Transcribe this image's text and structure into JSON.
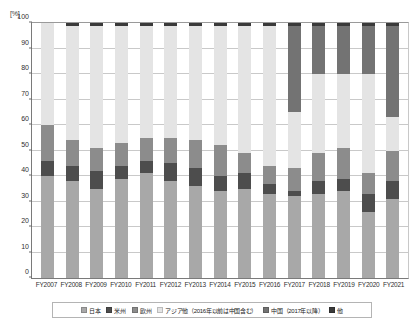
{
  "axis": {
    "y_unit": "[%]",
    "y_ticks": [
      0,
      10,
      20,
      30,
      40,
      50,
      60,
      70,
      80,
      90,
      100
    ]
  },
  "legend": {
    "items": [
      {
        "label": "日本",
        "color": "#a8a8a8",
        "key": "japan"
      },
      {
        "label": "米州",
        "color": "#4d4d4d",
        "key": "americas"
      },
      {
        "label": "欧州",
        "color": "#8c8c8c",
        "key": "europe"
      },
      {
        "label": "アジア他（2016年以前は中国含む）",
        "color": "#e4e4e4",
        "key": "asia_other"
      },
      {
        "label": "中国（2017年以降）",
        "color": "#737373",
        "key": "china"
      },
      {
        "label": "他",
        "color": "#3a3a3a",
        "key": "other"
      }
    ]
  },
  "chart_data": {
    "type": "bar",
    "stacked": true,
    "title": "",
    "xlabel": "",
    "ylabel": "[%]",
    "ylim": [
      0,
      100
    ],
    "grid": true,
    "legend_position": "bottom",
    "categories": [
      "FY2007",
      "FY2008",
      "FY2009",
      "FY2010",
      "FY2011",
      "FY2012",
      "FY2013",
      "FY2014",
      "FY2015",
      "FY2016",
      "FY2017",
      "FY2018",
      "FY2019",
      "FY2020",
      "FY2021"
    ],
    "series": [
      {
        "name": "日本",
        "color": "#a8a8a8",
        "values": [
          40,
          38,
          35,
          39,
          41,
          38,
          36,
          34,
          35,
          33,
          32,
          33,
          34,
          26,
          31
        ]
      },
      {
        "name": "米州",
        "color": "#4d4d4d",
        "values": [
          6,
          6,
          7,
          5,
          5,
          7,
          7,
          6,
          6,
          4,
          2,
          5,
          5,
          7,
          7
        ]
      },
      {
        "name": "欧州",
        "color": "#8c8c8c",
        "values": [
          14,
          10,
          9,
          9,
          9,
          10,
          11,
          12,
          8,
          7,
          9,
          11,
          12,
          8,
          12
        ]
      },
      {
        "name": "アジア他（2016年以前は中国含む）",
        "color": "#e4e4e4",
        "values": [
          40,
          45,
          48,
          46,
          44,
          44,
          45,
          47,
          50,
          55,
          22,
          31,
          29,
          39,
          13
        ]
      },
      {
        "name": "中国（2017年以降）",
        "color": "#737373",
        "values": [
          0,
          0,
          0,
          0,
          0,
          0,
          0,
          0,
          0,
          0,
          34,
          19,
          19,
          19,
          36
        ]
      },
      {
        "name": "他",
        "color": "#3a3a3a",
        "values": [
          0,
          1,
          1,
          1,
          1,
          1,
          1,
          1,
          1,
          1,
          1,
          1,
          1,
          1,
          1
        ]
      }
    ]
  }
}
